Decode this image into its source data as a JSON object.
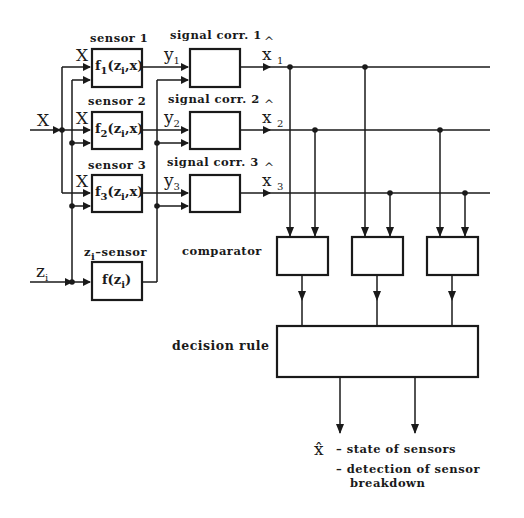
{
  "diagram": {
    "colors": {
      "line": "#1a1a1a",
      "background": "#ffffff"
    },
    "input": {
      "x_label": "X",
      "z_label": "z",
      "z_sub": "i"
    },
    "sensors": [
      {
        "title": "sensor 1",
        "in_label": "X",
        "fn": "f",
        "fn_sub": "1",
        "fn_args": "(z",
        "fn_args_sub": "i",
        "fn_args_end": ",x)"
      },
      {
        "title": "sensor 2",
        "in_label": "X",
        "fn": "f",
        "fn_sub": "2",
        "fn_args": "(z",
        "fn_args_sub": "i",
        "fn_args_end": ",x)"
      },
      {
        "title": "sensor 3",
        "in_label": "X",
        "fn": "f",
        "fn_sub": "3",
        "fn_args": "(z",
        "fn_args_sub": "i",
        "fn_args_end": ",x)"
      }
    ],
    "zsensor": {
      "title_z": "z",
      "title_sub": "i",
      "title_rest": "–sensor",
      "fn": "f(z",
      "fn_sub": "i",
      "fn_end": ")"
    },
    "correctors": [
      {
        "title": "signal corr. 1",
        "in_label": "y",
        "in_sub": "1",
        "out_label": "x",
        "out_sub": "1"
      },
      {
        "title": "signal corr. 2",
        "in_label": "y",
        "in_sub": "2",
        "out_label": "x",
        "out_sub": "2"
      },
      {
        "title": "signal corr. 3",
        "in_label": "y",
        "in_sub": "3",
        "out_label": "x",
        "out_sub": "3"
      }
    ],
    "comparator_label": "comparator",
    "decision_label": "decision rule",
    "outputs": {
      "symbol": "x̂",
      "line1": "– state of sensors",
      "line2": "– detection of sensor",
      "line3": "breakdown"
    }
  }
}
